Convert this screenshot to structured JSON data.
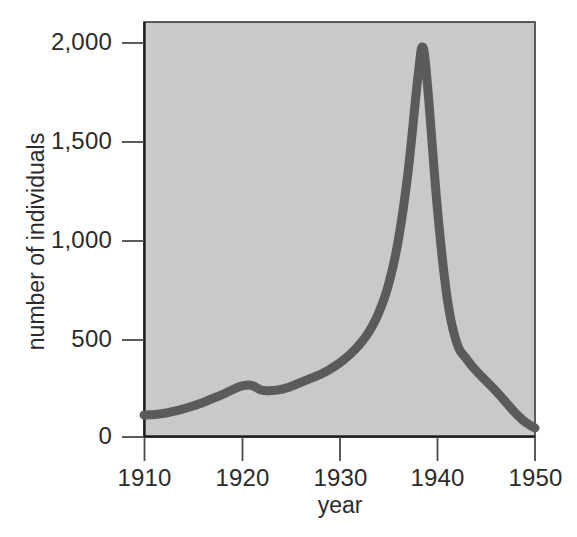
{
  "chart_data": {
    "type": "line",
    "title": "",
    "xlabel": "year",
    "ylabel": "number of individuals",
    "xlim": [
      1910,
      1950
    ],
    "ylim": [
      0,
      2075
    ],
    "grid": false,
    "legend": null,
    "plot_background_color": "#c9c9c9",
    "line_color": "#5b5b5b",
    "axis_color": "#2b2b2b",
    "x_ticks": [
      1910,
      1920,
      1930,
      1940,
      1950
    ],
    "x_tick_labels": [
      "1910",
      "1920",
      "1930",
      "1940",
      "1950"
    ],
    "y_ticks": [
      0,
      500,
      1000,
      1500,
      2000
    ],
    "y_tick_labels": [
      "0",
      "500",
      "1,000",
      "1,500",
      "2,000"
    ],
    "x": [
      1910,
      1911,
      1912,
      1913,
      1914,
      1915,
      1916,
      1917,
      1918,
      1919,
      1920,
      1921,
      1922,
      1923,
      1924,
      1925,
      1926,
      1927,
      1928,
      1929,
      1930,
      1931,
      1932,
      1933,
      1934,
      1935,
      1936,
      1937,
      1938,
      1938.5,
      1939,
      1940,
      1941,
      1942,
      1943,
      1944,
      1945,
      1946,
      1947,
      1948,
      1949,
      1950
    ],
    "values": [
      110,
      112,
      118,
      128,
      140,
      155,
      172,
      192,
      212,
      235,
      255,
      258,
      235,
      232,
      238,
      252,
      272,
      292,
      312,
      338,
      370,
      410,
      460,
      525,
      620,
      760,
      980,
      1320,
      1790,
      1950,
      1760,
      1150,
      700,
      470,
      390,
      330,
      280,
      230,
      175,
      120,
      75,
      45
    ],
    "annotations": []
  },
  "axis_labels": {
    "y_title": "number of individuals",
    "x_title": "year"
  }
}
